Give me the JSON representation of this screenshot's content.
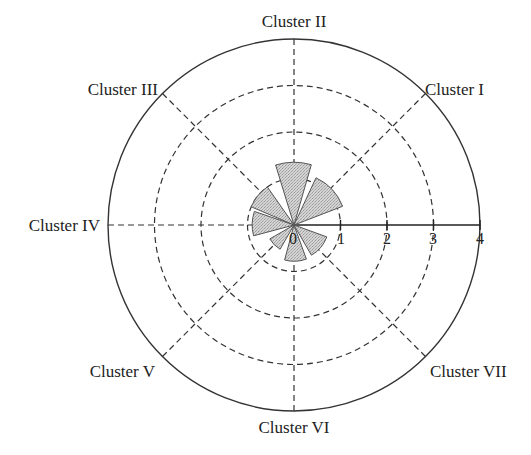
{
  "chart_data": {
    "type": "polar-bar",
    "title": "",
    "radial_axis": {
      "min": 0,
      "max": 4,
      "ticks": [
        0,
        1,
        2,
        3,
        4
      ],
      "grid_circles": [
        1,
        2,
        3
      ],
      "outer_circle": 4
    },
    "angular_axis": {
      "directions_deg": [
        45,
        90,
        135,
        180,
        225,
        270,
        315
      ],
      "grid": "dashed"
    },
    "categories": [
      "Cluster I",
      "Cluster II",
      "Cluster III",
      "Cluster IV",
      "Cluster V",
      "Cluster VI",
      "Cluster VII"
    ],
    "series": [
      {
        "name": "value",
        "values": [
          1.12,
          1.35,
          1.0,
          0.9,
          0.6,
          0.78,
          0.75
        ],
        "wedges_deg": [
          [
            21,
            65
          ],
          [
            74,
            107
          ],
          [
            125,
            157
          ],
          [
            161,
            195
          ],
          [
            210,
            240
          ],
          [
            255,
            290
          ],
          [
            300,
            340
          ]
        ]
      }
    ],
    "fill_color": "#c8c8c8",
    "stroke_color": "#555555"
  },
  "labels": {
    "cluster_1": "Cluster I",
    "cluster_2": "Cluster II",
    "cluster_3": "Cluster III",
    "cluster_4": "Cluster IV",
    "cluster_5": "Cluster V",
    "cluster_6": "Cluster VI",
    "cluster_7": "Cluster VII"
  },
  "ticks": {
    "t0": "0",
    "t1": "1",
    "t2": "2",
    "t3": "3",
    "t4": "4"
  }
}
